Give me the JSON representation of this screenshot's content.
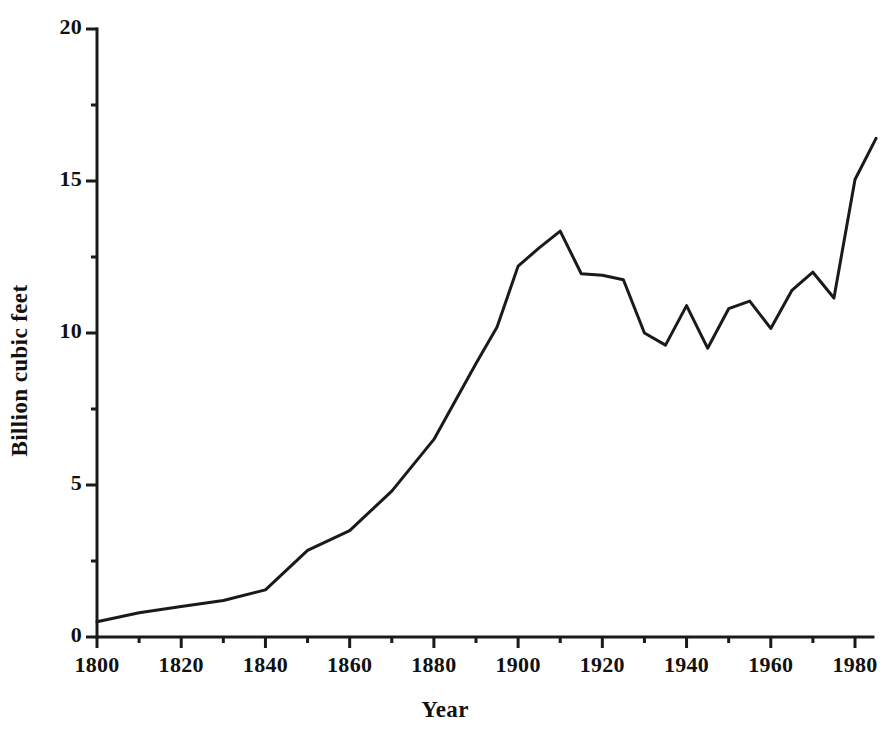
{
  "chart_data": {
    "type": "line",
    "title": "",
    "xlabel": "Year",
    "ylabel": "Billion cubic feet",
    "xlim": [
      1800,
      1985
    ],
    "ylim": [
      0,
      20
    ],
    "grid": false,
    "legend": "none",
    "line_color": "#1a1a1a",
    "line_width_px": 3,
    "x_major_ticks": [
      1800,
      1820,
      1840,
      1860,
      1880,
      1900,
      1920,
      1940,
      1960,
      1980
    ],
    "x_minor_ticks": [
      1810,
      1830,
      1850,
      1870,
      1890,
      1910,
      1930,
      1950,
      1970
    ],
    "x_tick_labels": [
      "1800",
      "1820",
      "1840",
      "1860",
      "1880",
      "1900",
      "1920",
      "1940",
      "1960",
      "1980"
    ],
    "y_major_ticks": [
      0,
      5,
      10,
      15,
      20
    ],
    "y_minor_ticks": [
      2.5,
      7.5,
      12.5,
      17.5
    ],
    "y_tick_labels": [
      "0",
      "5",
      "10",
      "15",
      "20"
    ],
    "x": [
      1800,
      1810,
      1820,
      1830,
      1840,
      1850,
      1860,
      1870,
      1880,
      1890,
      1895,
      1900,
      1905,
      1910,
      1915,
      1920,
      1925,
      1930,
      1935,
      1940,
      1945,
      1950,
      1955,
      1960,
      1965,
      1970,
      1975,
      1980,
      1985
    ],
    "values": [
      0.5,
      0.8,
      1.0,
      1.2,
      1.55,
      2.85,
      3.5,
      4.8,
      6.5,
      9.0,
      10.2,
      12.2,
      12.8,
      13.35,
      11.95,
      11.9,
      11.75,
      10.0,
      9.6,
      10.9,
      9.5,
      10.8,
      11.05,
      10.15,
      11.4,
      12.0,
      11.15,
      15.05,
      16.4
    ],
    "annotations": []
  },
  "axes": {
    "x_title": "Year",
    "y_title": "Billion cubic feet"
  }
}
